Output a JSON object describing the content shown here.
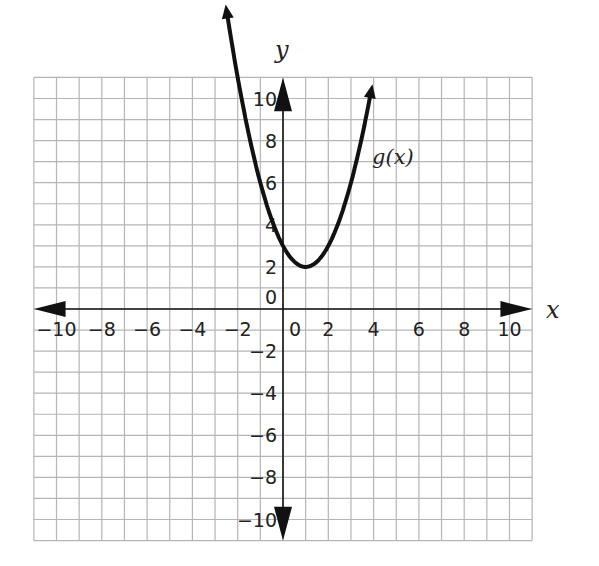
{
  "chart_data": {
    "type": "line",
    "title": "",
    "xlabel": "x",
    "ylabel": "y",
    "xlim": [
      -11,
      11
    ],
    "ylim": [
      -11,
      11
    ],
    "grid": true,
    "x_ticks": [
      -10,
      -8,
      -6,
      -4,
      -2,
      0,
      2,
      4,
      6,
      8,
      10
    ],
    "y_ticks": [
      -10,
      -8,
      -6,
      -4,
      -2,
      0,
      2,
      4,
      6,
      8,
      10
    ],
    "x_tick_labels": [
      "−10",
      "−8",
      "−6",
      "−4",
      "−2",
      "0",
      "2",
      "4",
      "6",
      "8",
      "10"
    ],
    "y_tick_labels": [
      "−10",
      "−8",
      "−6",
      "−4",
      "−2",
      "0",
      "2",
      "4",
      "6",
      "8",
      "10"
    ],
    "series": [
      {
        "name": "g(x)",
        "expression": "g(x) = (x - 1)^2 + 2",
        "vertex": [
          1,
          2
        ],
        "y_intercept": [
          0,
          3
        ],
        "x": [
          -2.6,
          -2,
          -1,
          0,
          1,
          2,
          3,
          3.9
        ],
        "values": [
          10.96,
          11,
          6,
          3,
          2,
          3,
          6,
          10.41
        ]
      }
    ],
    "annotations": [
      {
        "text": "g(x)",
        "x": 4.4,
        "y": 7.3
      }
    ]
  },
  "labels": {
    "x_axis": "x",
    "y_axis": "y",
    "function": "g(x)"
  },
  "colors": {
    "grid": "#b5b5b5",
    "axis": "#111111",
    "curve": "#111111",
    "background": "#ffffff"
  }
}
